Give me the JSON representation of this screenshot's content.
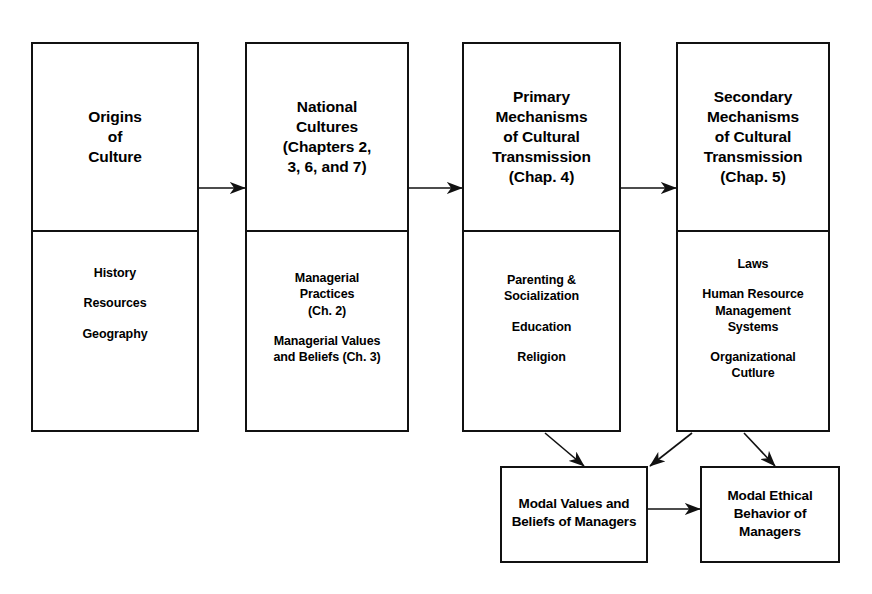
{
  "diagram": {
    "stroke_color": "#111111",
    "background_color": "#ffffff",
    "stages": [
      {
        "id": "origins-of-culture",
        "header": "Origins\nof\nCulture",
        "items": [
          "History",
          "Resources",
          "Geography"
        ]
      },
      {
        "id": "national-cultures",
        "header": "National\nCultures\n(Chapters 2,\n3, 6, and 7)",
        "items": [
          "Managerial\nPractices\n(Ch. 2)",
          "Managerial Values\nand Beliefs (Ch. 3)"
        ]
      },
      {
        "id": "primary-mechanisms",
        "header": "Primary\nMechanisms\nof Cultural\nTransmission\n(Chap. 4)",
        "items": [
          "Parenting &\nSocialization",
          "Education",
          "Religion"
        ]
      },
      {
        "id": "secondary-mechanisms",
        "header": "Secondary\nMechanisms\nof Cultural\nTransmission\n(Chap. 5)",
        "items": [
          "Laws",
          "Human Resource\nManagement\nSystems",
          "Organizational\nCutlure"
        ]
      }
    ],
    "outcomes": [
      {
        "id": "modal-values",
        "label": "Modal Values and\nBeliefs of Managers"
      },
      {
        "id": "modal-ethical-behavior",
        "label": "Modal Ethical\nBehavior of\nManagers"
      }
    ],
    "connectors": [
      {
        "id": "origins-to-national",
        "from": "origins-of-culture",
        "to": "national-cultures",
        "kind": "horizontal-arrow"
      },
      {
        "id": "national-to-primary",
        "from": "national-cultures",
        "to": "primary-mechanisms",
        "kind": "horizontal-arrow"
      },
      {
        "id": "primary-to-secondary",
        "from": "primary-mechanisms",
        "to": "secondary-mechanisms",
        "kind": "horizontal-arrow"
      },
      {
        "id": "primary-to-modal-values",
        "from": "primary-mechanisms",
        "to": "modal-values",
        "kind": "diagonal-arrow"
      },
      {
        "id": "secondary-to-modal-values",
        "from": "secondary-mechanisms",
        "to": "modal-values",
        "kind": "diagonal-arrow"
      },
      {
        "id": "secondary-to-modal-ethical",
        "from": "secondary-mechanisms",
        "to": "modal-ethical-behavior",
        "kind": "diagonal-arrow"
      },
      {
        "id": "modal-values-to-modal-ethical",
        "from": "modal-values",
        "to": "modal-ethical-behavior",
        "kind": "horizontal-arrow"
      }
    ]
  }
}
